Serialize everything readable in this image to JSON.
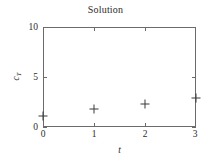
{
  "chart_data": {
    "type": "scatter",
    "title": "Solution",
    "xlabel": "t",
    "ylabel": "c",
    "ylabel_sub": "T",
    "x": [
      0,
      1,
      2,
      3
    ],
    "values": [
      1.1,
      1.8,
      2.3,
      2.9
    ],
    "series": [
      {
        "name": "c_T",
        "marker": "plus",
        "color": "#3a3a3a",
        "points": [
          {
            "x": 0,
            "y": 1.1
          },
          {
            "x": 1,
            "y": 1.8
          },
          {
            "x": 2,
            "y": 2.3
          },
          {
            "x": 3,
            "y": 2.9
          }
        ]
      }
    ],
    "xlim": [
      0,
      3
    ],
    "ylim": [
      0,
      10
    ],
    "xticks": [
      0,
      1,
      2,
      3
    ],
    "yticks": [
      0,
      5,
      10
    ],
    "xtick_labels": [
      "0",
      "1",
      "2",
      "3"
    ],
    "ytick_labels": [
      "0",
      "5",
      "10"
    ],
    "grid": false,
    "legend": null,
    "frame": true,
    "axis_color": "#6b6b6b",
    "text_color": "#2b2b2b"
  }
}
